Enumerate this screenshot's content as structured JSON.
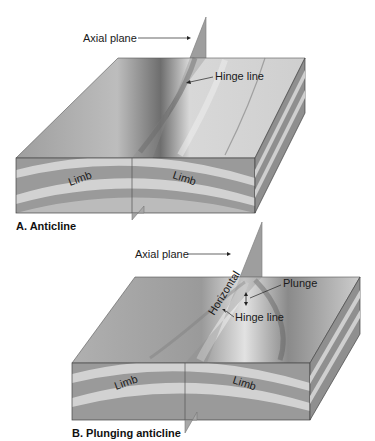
{
  "diagrams": [
    {
      "id": "A",
      "caption": "A. Anticline",
      "labels": {
        "axial_plane": "Axial plane",
        "hinge_line": "Hinge line",
        "limb_left": "Limb",
        "limb_right": "Limb"
      }
    },
    {
      "id": "B",
      "caption": "B. Plunging anticline",
      "labels": {
        "axial_plane": "Axial plane",
        "horizontal": "Horizontal",
        "plunge": "Plunge",
        "hinge_line": "Hinge line",
        "limb_left": "Limb",
        "limb_right": "Limb"
      }
    }
  ],
  "colors": {
    "background": "#ffffff",
    "band_dark": "#9a9a9a",
    "band_light": "#d2d2d2",
    "surface": "#c4c4c4",
    "plane": "#8c8c8c",
    "text": "#1a1a1a"
  }
}
